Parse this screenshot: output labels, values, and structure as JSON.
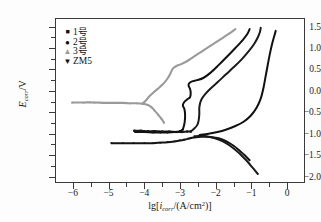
{
  "chart_data": {
    "type": "line",
    "title": "",
    "xlabel": "lg[icorr/(A/cm2)]",
    "ylabel": "Ecorr/V",
    "xlim": [
      -6.5,
      0.5
    ],
    "ylim": [
      -2.15,
      1.7
    ],
    "grid": false,
    "legend_position": "top-left",
    "xticks": [
      -6,
      -5,
      -4,
      -3,
      -2,
      -1,
      0
    ],
    "xtick_labels": [
      "-6",
      "-5",
      "-4",
      "-3",
      "-2",
      "-1",
      "0"
    ],
    "yticks": [
      1.5,
      1.0,
      0.5,
      0.0,
      -0.5,
      -1.0,
      -1.5,
      -2.0
    ],
    "ytick_labels": [
      "1.5",
      "1.0",
      "0.5",
      "0.0",
      "-0.5",
      "-1.0",
      "-1.5",
      "-2.0"
    ],
    "series": [
      {
        "name": "1-hao",
        "marker": "square",
        "color": "#1a1a1a",
        "corrosion_potential": -0.95,
        "cathodic": [
          [
            -4.28,
            -0.93
          ],
          [
            -4.1,
            -0.93
          ],
          [
            -3.9,
            -0.94
          ],
          [
            -3.7,
            -0.94
          ],
          [
            -3.5,
            -0.95
          ],
          [
            -3.3,
            -0.95
          ],
          [
            -3.1,
            -0.96
          ],
          [
            -2.95,
            -0.96
          ],
          [
            -2.8,
            -0.95
          ],
          [
            -2.7,
            -0.95
          ]
        ],
        "anodic": [
          [
            -2.7,
            -0.95
          ],
          [
            -2.6,
            -0.88
          ],
          [
            -2.52,
            -0.8
          ],
          [
            -2.48,
            -0.7
          ],
          [
            -2.46,
            -0.55
          ],
          [
            -2.46,
            -0.4
          ],
          [
            -2.44,
            -0.3
          ],
          [
            -2.4,
            -0.2
          ],
          [
            -2.3,
            -0.08
          ],
          [
            -2.15,
            0.05
          ],
          [
            -1.95,
            0.2
          ],
          [
            -1.72,
            0.38
          ],
          [
            -1.5,
            0.55
          ],
          [
            -1.28,
            0.73
          ],
          [
            -1.08,
            0.92
          ],
          [
            -0.92,
            1.1
          ],
          [
            -0.82,
            1.25
          ],
          [
            -0.76,
            1.38
          ],
          [
            -0.74,
            1.47
          ]
        ]
      },
      {
        "name": "2-hao",
        "marker": "circle",
        "color": "#111111",
        "corrosion_potential": -0.96,
        "cathodic": [
          [
            -4.25,
            -0.96
          ],
          [
            -4.0,
            -0.96
          ],
          [
            -3.75,
            -0.97
          ],
          [
            -3.55,
            -0.97
          ],
          [
            -3.35,
            -0.97
          ],
          [
            -3.15,
            -0.96
          ],
          [
            -3.0,
            -0.94
          ],
          [
            -2.92,
            -0.9
          ]
        ],
        "anodic": [
          [
            -2.92,
            -0.9
          ],
          [
            -2.88,
            -0.78
          ],
          [
            -2.86,
            -0.65
          ],
          [
            -2.86,
            -0.52
          ],
          [
            -2.88,
            -0.42
          ],
          [
            -2.92,
            -0.34
          ],
          [
            -2.88,
            -0.26
          ],
          [
            -2.8,
            -0.2
          ],
          [
            -2.72,
            -0.15
          ],
          [
            -2.7,
            -0.05
          ],
          [
            -2.72,
            0.05
          ],
          [
            -2.76,
            0.12
          ],
          [
            -2.74,
            0.18
          ],
          [
            -2.66,
            0.22
          ],
          [
            -2.52,
            0.25
          ],
          [
            -2.35,
            0.3
          ],
          [
            -2.15,
            0.42
          ],
          [
            -1.92,
            0.6
          ],
          [
            -1.68,
            0.8
          ],
          [
            -1.45,
            1.0
          ],
          [
            -1.25,
            1.18
          ],
          [
            -1.12,
            1.32
          ],
          [
            -1.05,
            1.44
          ]
        ]
      },
      {
        "name": "3-hao",
        "marker": "triangle-up",
        "color": "#9a9a9a",
        "corrosion_potential": -0.27,
        "cathodic": [
          [
            -6.02,
            -0.27
          ],
          [
            -5.7,
            -0.27
          ],
          [
            -5.4,
            -0.27
          ],
          [
            -5.1,
            -0.28
          ],
          [
            -4.85,
            -0.28
          ],
          [
            -4.6,
            -0.28
          ],
          [
            -4.4,
            -0.29
          ],
          [
            -4.2,
            -0.29
          ],
          [
            -4.05,
            -0.3
          ],
          [
            -3.9,
            -0.33
          ],
          [
            -3.8,
            -0.38
          ],
          [
            -3.72,
            -0.45
          ],
          [
            -3.62,
            -0.55
          ],
          [
            -3.52,
            -0.65
          ],
          [
            -3.45,
            -0.74
          ]
        ],
        "anodic": [
          [
            -4.05,
            -0.3
          ],
          [
            -3.95,
            -0.22
          ],
          [
            -3.85,
            -0.12
          ],
          [
            -3.72,
            -0.02
          ],
          [
            -3.58,
            0.08
          ],
          [
            -3.45,
            0.18
          ],
          [
            -3.34,
            0.3
          ],
          [
            -3.26,
            0.42
          ],
          [
            -3.2,
            0.52
          ],
          [
            -3.1,
            0.58
          ],
          [
            -2.95,
            0.63
          ],
          [
            -2.75,
            0.72
          ],
          [
            -2.52,
            0.85
          ],
          [
            -2.28,
            0.98
          ],
          [
            -2.02,
            1.12
          ],
          [
            -1.78,
            1.25
          ],
          [
            -1.58,
            1.36
          ],
          [
            -1.45,
            1.44
          ]
        ]
      },
      {
        "name": "ZM5",
        "marker": "triangle-down",
        "color": "#141414",
        "corrosion_potential": -1.22,
        "cathodic": [
          [
            -4.92,
            -1.22
          ],
          [
            -4.6,
            -1.22
          ],
          [
            -4.3,
            -1.22
          ],
          [
            -4.0,
            -1.22
          ],
          [
            -3.75,
            -1.22
          ],
          [
            -3.55,
            -1.21
          ],
          [
            -3.35,
            -1.2
          ],
          [
            -3.15,
            -1.18
          ],
          [
            -3.0,
            -1.16
          ],
          [
            -2.88,
            -1.14
          ],
          [
            -2.78,
            -1.12
          ],
          [
            -2.7,
            -1.1
          ]
        ],
        "anodic": [
          [
            -2.7,
            -1.1
          ],
          [
            -2.55,
            -1.08
          ],
          [
            -2.4,
            -1.07
          ],
          [
            -2.25,
            -1.07
          ],
          [
            -2.1,
            -1.08
          ],
          [
            -1.95,
            -1.1
          ],
          [
            -1.8,
            -1.14
          ],
          [
            -1.65,
            -1.2
          ],
          [
            -1.5,
            -1.28
          ],
          [
            -1.35,
            -1.38
          ],
          [
            -1.22,
            -1.48
          ],
          [
            -1.12,
            -1.56
          ],
          [
            -1.05,
            -1.62
          ]
        ]
      },
      {
        "name": "1-hao-anodic-lower",
        "marker": "square",
        "color": "#1a1a1a",
        "corrosion_potential": -1.05,
        "cathodic": [],
        "anodic": [
          [
            -2.6,
            -1.06
          ],
          [
            -2.4,
            -1.05
          ],
          [
            -2.2,
            -1.07
          ],
          [
            -2.0,
            -1.11
          ],
          [
            -1.8,
            -1.18
          ],
          [
            -1.6,
            -1.28
          ],
          [
            -1.42,
            -1.4
          ],
          [
            -1.25,
            -1.53
          ],
          [
            -1.1,
            -1.66
          ],
          [
            -0.98,
            -1.78
          ],
          [
            -0.88,
            -1.88
          ],
          [
            -0.82,
            -1.94
          ]
        ]
      },
      {
        "name": "2-hao-anodic-outer",
        "marker": "circle",
        "color": "#111111",
        "corrosion_potential": -1.02,
        "cathodic": [],
        "anodic": [
          [
            -2.45,
            -1.03
          ],
          [
            -2.2,
            -1.0
          ],
          [
            -1.95,
            -0.96
          ],
          [
            -1.7,
            -0.9
          ],
          [
            -1.45,
            -0.82
          ],
          [
            -1.22,
            -0.72
          ],
          [
            -1.02,
            -0.58
          ],
          [
            -0.86,
            -0.4
          ],
          [
            -0.74,
            -0.18
          ],
          [
            -0.66,
            0.08
          ],
          [
            -0.6,
            0.35
          ],
          [
            -0.54,
            0.62
          ],
          [
            -0.48,
            0.88
          ],
          [
            -0.42,
            1.1
          ],
          [
            -0.36,
            1.28
          ],
          [
            -0.32,
            1.4
          ]
        ]
      }
    ]
  },
  "legend": {
    "items": [
      {
        "marker": "square",
        "label": "1号"
      },
      {
        "marker": "circle",
        "label": "2号"
      },
      {
        "marker": "triangle-up",
        "label": "3号"
      },
      {
        "marker": "triangle-down",
        "label": "ZM5"
      }
    ]
  },
  "axes": {
    "y_title_base": "E",
    "y_title_sub": "corr",
    "y_title_unit": "/V",
    "x_title_prefix": "lg[",
    "x_title_base": "i",
    "x_title_sub": "corr",
    "x_title_mid": "/(A/cm",
    "x_title_sup": "2",
    "x_title_suffix": ")]",
    "ytick_labels": [
      "1.5",
      "1.0",
      "0.5",
      "0.0",
      "−0.5",
      "−1.0",
      "−1.5",
      "−2.0"
    ],
    "xtick_labels": [
      "−6",
      "−5",
      "−4",
      "−3",
      "−2",
      "−1",
      "0"
    ]
  }
}
